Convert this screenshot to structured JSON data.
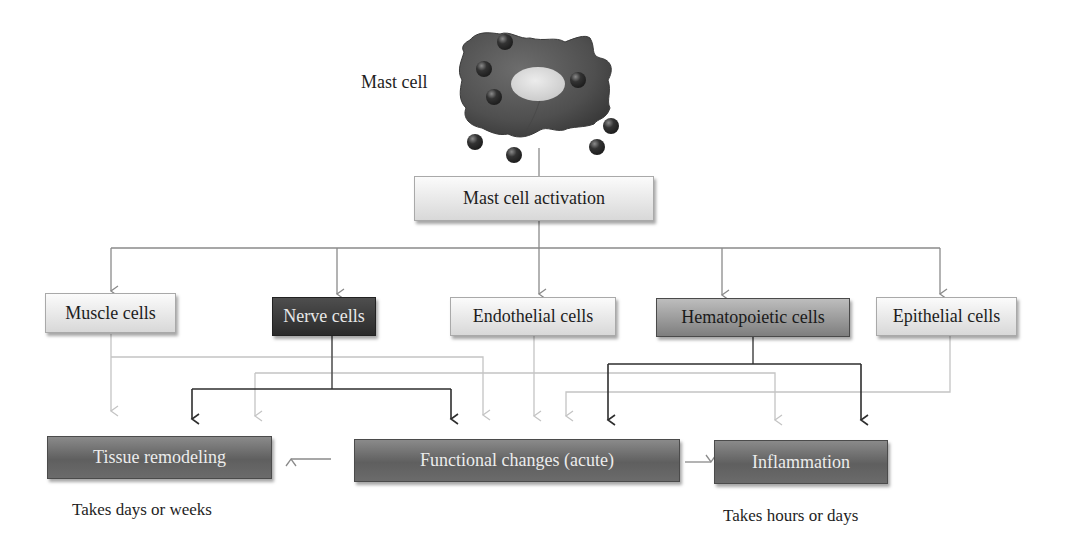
{
  "diagram": {
    "title_label": "Mast cell",
    "activation": "Mast cell activation",
    "target_cells": [
      {
        "id": "muscle",
        "label": "Muscle cells",
        "style": "light"
      },
      {
        "id": "nerve",
        "label": "Nerve cells",
        "style": "dark"
      },
      {
        "id": "endothelial",
        "label": "Endothelial cells",
        "style": "light"
      },
      {
        "id": "hematopoietic",
        "label": "Hematopoietic cells",
        "style": "mid"
      },
      {
        "id": "epithelial",
        "label": "Epithelial cells",
        "style": "light"
      }
    ],
    "outcomes": [
      {
        "id": "tissue",
        "label": "Tissue remodeling"
      },
      {
        "id": "functional",
        "label": "Functional changes (acute)"
      },
      {
        "id": "inflammation",
        "label": "Inflammation"
      }
    ],
    "timescales": {
      "tissue": "Takes days or weeks",
      "inflammation": "Takes hours or days"
    },
    "colors": {
      "cell_body": "#555555",
      "nucleus": "#d9d9d9",
      "granule": "#3a3a3a",
      "wire_mid": "#8a8a8a",
      "wire_dark": "#2e2e2e",
      "wire_light": "#c4c4c4"
    }
  }
}
